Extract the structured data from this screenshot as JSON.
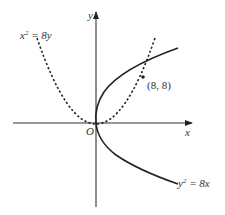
{
  "diagram": {
    "axes": {
      "x_label": "x",
      "y_label": "y",
      "origin_label": "O"
    },
    "curves": [
      {
        "name": "parabola-x2-8y",
        "label_lhs": "x",
        "label_exp": "2",
        "label_rhs": " = 8y",
        "style": "dashed"
      },
      {
        "name": "parabola-y2-8x",
        "label_lhs": "y",
        "label_exp": "2",
        "label_rhs": " = 8x",
        "style": "solid"
      }
    ],
    "intersection": {
      "label": "(8, 8)",
      "x": 8,
      "y": 8
    },
    "colors": {
      "stroke": "#222222",
      "text": "#333333"
    }
  }
}
